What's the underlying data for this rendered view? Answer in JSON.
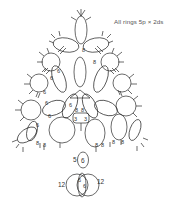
{
  "note": "All rings 5p × 2ds",
  "diagram": {
    "labels": {
      "chain_count": "6",
      "chain_count_b": "8",
      "center_left": "3",
      "center_right": "3",
      "stem_chain": "5",
      "stem_ring": "6",
      "big_ring_left": "12",
      "big_ring_right": "12",
      "inner_left": "6",
      "inner_right": "6"
    },
    "colors": {
      "line": "#2b2b2b",
      "text": "#555555",
      "background": "#ffffff"
    }
  }
}
